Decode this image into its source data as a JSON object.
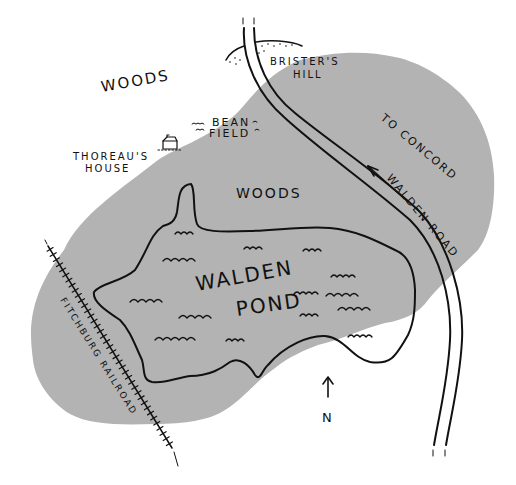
{
  "map": {
    "title": "Walden Pond",
    "colors": {
      "background": "#ffffff",
      "woods_fill": "#b3b3b3",
      "ink": "#111111"
    },
    "labels": {
      "woods_north": "WOODS",
      "woods_south": "WOODS",
      "bean_field_line1": "BEAN",
      "bean_field_line2": "FIELD",
      "thoreaus_house_line1": "THOREAU'S",
      "thoreaus_house_line2": "HOUSE",
      "bristers_hill_line1": "BRISTER'S",
      "bristers_hill_line2": "HILL",
      "to_concord": "TO CONCORD",
      "walden_road": "WALDEN ROAD",
      "pond_line1": "WALDEN",
      "pond_line2": "POND",
      "railroad": "FITCHBURG RAILROAD",
      "north": "N"
    },
    "features": [
      {
        "name": "Woods",
        "type": "area"
      },
      {
        "name": "Walden Pond",
        "type": "water"
      },
      {
        "name": "Walden Road",
        "type": "road",
        "direction": "To Concord"
      },
      {
        "name": "Fitchburg Railroad",
        "type": "railroad"
      },
      {
        "name": "Thoreau's House",
        "type": "building"
      },
      {
        "name": "Bean Field",
        "type": "field"
      },
      {
        "name": "Brister's Hill",
        "type": "hill"
      }
    ],
    "compass": {
      "direction": "N",
      "icon": "north-arrow-icon"
    }
  }
}
